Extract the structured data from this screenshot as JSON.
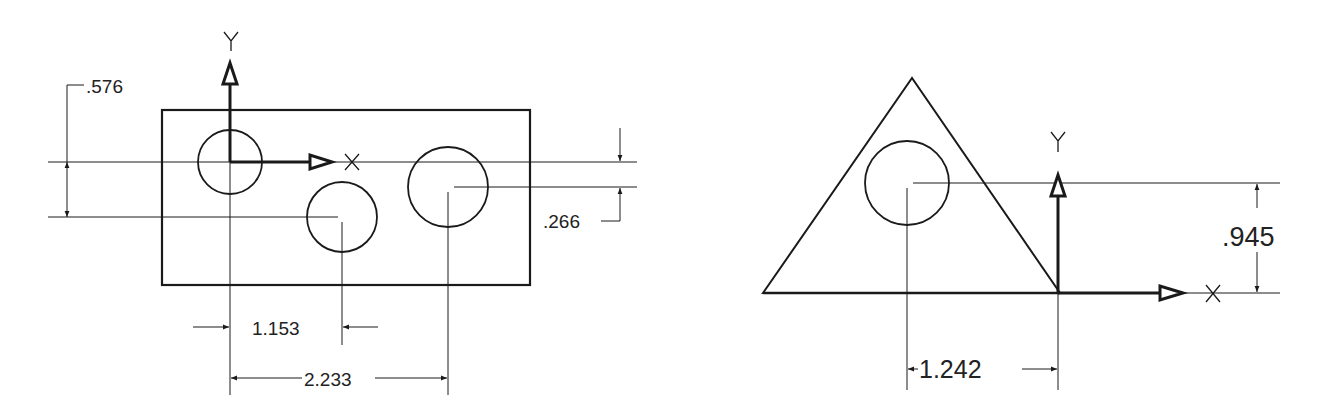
{
  "colors": {
    "line": "#1a1a1a",
    "text": "#222222",
    "background": "#ffffff"
  },
  "figure_left": {
    "axis_labels": {
      "y": "Y",
      "x": "X"
    },
    "dimensions": {
      "vertical_576": ".576",
      "vertical_266": ".266",
      "horizontal_1153": "1.153",
      "horizontal_2233": "2.233"
    },
    "description": "Rectangular plate with three holes and relative coordinate origin at first hole center"
  },
  "figure_right": {
    "axis_labels": {
      "y": "Y",
      "x": "X"
    },
    "dimensions": {
      "vertical_945": ".945",
      "horizontal_1242": "1.242"
    },
    "description": "Triangular plate with one hole, origin at lower-right vertex"
  }
}
